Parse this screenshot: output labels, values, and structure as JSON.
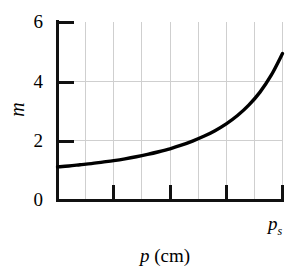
{
  "chart_data": {
    "type": "line",
    "title": "",
    "subtitle": "",
    "xlabel": "p (cm)",
    "xlabel_symbol": "p",
    "xlabel_units": "(cm)",
    "ylabel": "m",
    "xlim": [
      0,
      1
    ],
    "ylim": [
      0,
      6
    ],
    "grid": true,
    "legend": null,
    "y_ticks": [
      0,
      2,
      4,
      6
    ],
    "y_tick_labels": [
      "0",
      "2",
      "4",
      "6"
    ],
    "x_tick_labels": [
      "",
      "",
      "",
      "p_s"
    ],
    "x_end_label": "p",
    "x_end_label_sub": "s",
    "x_gridline_count": 8,
    "x_major_tick_positions": [
      0.25,
      0.5,
      0.75,
      1.0
    ],
    "series": [
      {
        "name": "m(p)",
        "color": "#000000",
        "linewidth": 3.4,
        "x": [
          0.0,
          0.05,
          0.1,
          0.15,
          0.2,
          0.25,
          0.3,
          0.35,
          0.4,
          0.45,
          0.5,
          0.55,
          0.6,
          0.65,
          0.7,
          0.75,
          0.8,
          0.85,
          0.9,
          0.95,
          1.0
        ],
        "y": [
          1.1,
          1.13,
          1.17,
          1.21,
          1.26,
          1.31,
          1.37,
          1.44,
          1.52,
          1.61,
          1.71,
          1.83,
          1.97,
          2.13,
          2.32,
          2.55,
          2.83,
          3.18,
          3.62,
          4.19,
          4.92
        ]
      }
    ]
  },
  "axis": {
    "y_label": "m",
    "y_tick_6": "6",
    "y_tick_4": "4",
    "y_tick_2": "2",
    "y_tick_0": "0",
    "x_title_symbol": "p",
    "x_title_units": "(cm)",
    "x_end_symbol": "p",
    "x_end_sub": "s"
  },
  "colors": {
    "curve": "#000000",
    "axis": "#111111",
    "grid": "#cfcfcf",
    "background": "#ffffff"
  }
}
